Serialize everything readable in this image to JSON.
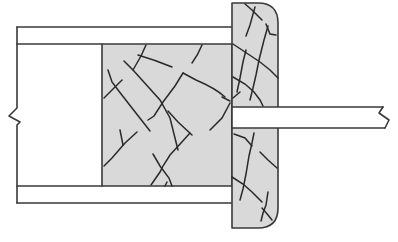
{
  "diagram": {
    "type": "cross-section",
    "colors": {
      "fill": "#d9d9d9",
      "stroke": "#3a3a3a",
      "background": "#ffffff"
    },
    "components": [
      {
        "id": "tube-wall-top",
        "label": ""
      },
      {
        "id": "tube-wall-bottom",
        "label": ""
      },
      {
        "id": "core-block",
        "label": ""
      },
      {
        "id": "end-cap",
        "label": ""
      },
      {
        "id": "rod",
        "label": ""
      },
      {
        "id": "break-line-left",
        "label": ""
      },
      {
        "id": "break-line-right",
        "label": ""
      }
    ],
    "text_labels": []
  }
}
